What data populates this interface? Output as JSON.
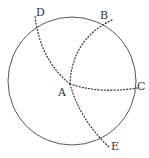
{
  "diagram": {
    "colors": {
      "circle_stroke": "#555555",
      "arc_stroke": "#444444",
      "label": "#333333",
      "background": "#ffffff"
    },
    "circle": {
      "cx": 72,
      "cy": 81,
      "r": 64
    },
    "points": {
      "A": {
        "label": "A",
        "x": 70,
        "y": 84
      },
      "B": {
        "label": "B",
        "x": 110,
        "y": 19
      },
      "C": {
        "label": "C",
        "x": 135,
        "y": 89
      },
      "D": {
        "label": "D",
        "x": 35,
        "y": 18
      },
      "E": {
        "label": "E",
        "x": 108,
        "y": 146
      }
    },
    "labels": {
      "A": {
        "text": "A",
        "x": 58,
        "y": 96
      },
      "B": {
        "text": "B",
        "x": 100,
        "y": 19
      },
      "C": {
        "text": "C",
        "x": 137,
        "y": 90
      },
      "D": {
        "text": "D",
        "x": 36,
        "y": 16
      },
      "E": {
        "text": "E",
        "x": 111,
        "y": 150
      }
    },
    "arcs": [
      {
        "name": "arc-AD",
        "from": "A",
        "to": "D",
        "style": "dotted"
      },
      {
        "name": "arc-AB",
        "from": "A",
        "to": "B",
        "style": "dotted"
      },
      {
        "name": "arc-AC",
        "from": "A",
        "to": "C",
        "style": "dotted"
      },
      {
        "name": "arc-AE",
        "from": "A",
        "to": "E",
        "style": "dotted"
      }
    ]
  }
}
